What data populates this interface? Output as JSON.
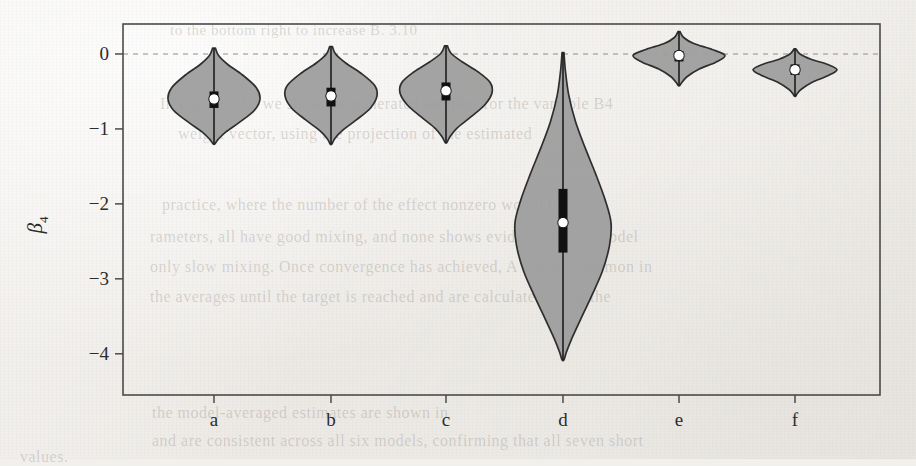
{
  "figure": {
    "background_color": "#f2f0ed",
    "plot_area": {
      "x": 123,
      "y": 24,
      "width": 757,
      "height": 371
    }
  },
  "ghost_text": [
    {
      "text": "to the bottom right to increase  B. 3.10",
      "x": 170,
      "y": 22,
      "size": 15
    },
    {
      "text": "In Figure 4.10 we show the generated samples for the variable B4",
      "x": 160,
      "y": 95,
      "size": 16
    },
    {
      "text": "weight vector, using the projection of the estimated",
      "x": 178,
      "y": 125,
      "size": 16
    },
    {
      "text": "practice, where the number of the effect nonzero would be par-",
      "x": 162,
      "y": 196,
      "size": 16
    },
    {
      "text": "rameters, all have good mixing, and none shows evidence of the model",
      "x": 150,
      "y": 228,
      "size": 16
    },
    {
      "text": "only slow mixing. Once convergence has achieved, A is most common in",
      "x": 150,
      "y": 258,
      "size": 16
    },
    {
      "text": "the averages until the target is reached and are calculated using the",
      "x": 150,
      "y": 288,
      "size": 16
    },
    {
      "text": "the model-averaged estimates are shown in",
      "x": 152,
      "y": 404,
      "size": 16
    },
    {
      "text": "and are consistent across all six models, confirming that all seven short",
      "x": 152,
      "y": 432,
      "size": 16
    },
    {
      "text": "values.",
      "x": 20,
      "y": 448,
      "size": 16
    }
  ],
  "axes": {
    "y_label": "β",
    "y_label_subscript": "4",
    "y_ticks": [
      {
        "value": 0,
        "label": "0"
      },
      {
        "value": -1,
        "label": "−1"
      },
      {
        "value": -2,
        "label": "−2"
      },
      {
        "value": -3,
        "label": "−3"
      },
      {
        "value": -4,
        "label": "−4"
      }
    ],
    "y_range": [
      -4.55,
      0.4
    ],
    "x_ticks": [
      "a",
      "b",
      "c",
      "d",
      "e",
      "f"
    ],
    "reference_line": {
      "value": 0,
      "style": "dashed",
      "color": "#8d8d8d"
    }
  },
  "chart_data": {
    "type": "violin",
    "title": "",
    "xlabel": "",
    "ylabel": "β₄",
    "ylim": [
      -4.55,
      0.4
    ],
    "grid": false,
    "legend": null,
    "categories": [
      "a",
      "b",
      "c",
      "d",
      "e",
      "f"
    ],
    "reference_line_y": 0,
    "series": [
      {
        "name": "a",
        "category": "a",
        "center_px": 214,
        "median": -0.6,
        "q1": -0.72,
        "q3": -0.5,
        "whisker_low": -1.12,
        "whisker_high": -0.08,
        "min": -1.2,
        "max": 0.08,
        "max_half_width_px": 46,
        "density": [
          {
            "y": 0.08,
            "w": 0.03
          },
          {
            "y": -0.02,
            "w": 0.1
          },
          {
            "y": -0.14,
            "w": 0.3
          },
          {
            "y": -0.28,
            "w": 0.62
          },
          {
            "y": -0.45,
            "w": 0.92
          },
          {
            "y": -0.6,
            "w": 1.0
          },
          {
            "y": -0.75,
            "w": 0.88
          },
          {
            "y": -0.9,
            "w": 0.58
          },
          {
            "y": -1.04,
            "w": 0.26
          },
          {
            "y": -1.14,
            "w": 0.09
          },
          {
            "y": -1.2,
            "w": 0.02
          }
        ]
      },
      {
        "name": "b",
        "category": "b",
        "center_px": 331,
        "median": -0.56,
        "q1": -0.7,
        "q3": -0.45,
        "whisker_low": -1.1,
        "whisker_high": -0.06,
        "min": -1.2,
        "max": 0.1,
        "max_half_width_px": 46,
        "density": [
          {
            "y": 0.1,
            "w": 0.03
          },
          {
            "y": 0.0,
            "w": 0.1
          },
          {
            "y": -0.12,
            "w": 0.32
          },
          {
            "y": -0.26,
            "w": 0.66
          },
          {
            "y": -0.42,
            "w": 0.95
          },
          {
            "y": -0.56,
            "w": 1.0
          },
          {
            "y": -0.72,
            "w": 0.86
          },
          {
            "y": -0.88,
            "w": 0.55
          },
          {
            "y": -1.02,
            "w": 0.25
          },
          {
            "y": -1.13,
            "w": 0.08
          },
          {
            "y": -1.2,
            "w": 0.02
          }
        ]
      },
      {
        "name": "c",
        "category": "c",
        "center_px": 446,
        "median": -0.49,
        "q1": -0.62,
        "q3": -0.38,
        "whisker_low": -1.08,
        "whisker_high": -0.02,
        "min": -1.18,
        "max": 0.11,
        "max_half_width_px": 46,
        "density": [
          {
            "y": 0.11,
            "w": 0.03
          },
          {
            "y": 0.01,
            "w": 0.11
          },
          {
            "y": -0.1,
            "w": 0.34
          },
          {
            "y": -0.24,
            "w": 0.7
          },
          {
            "y": -0.38,
            "w": 0.96
          },
          {
            "y": -0.52,
            "w": 1.0
          },
          {
            "y": -0.68,
            "w": 0.84
          },
          {
            "y": -0.84,
            "w": 0.54
          },
          {
            "y": -0.99,
            "w": 0.24
          },
          {
            "y": -1.11,
            "w": 0.08
          },
          {
            "y": -1.18,
            "w": 0.02
          }
        ]
      },
      {
        "name": "d",
        "category": "d",
        "center_px": 563,
        "median": -2.25,
        "q1": -2.65,
        "q3": -1.8,
        "whisker_low": -3.85,
        "whisker_high": -0.25,
        "min": -4.08,
        "max": 0.02,
        "max_half_width_px": 48,
        "density": [
          {
            "y": 0.02,
            "w": 0.02
          },
          {
            "y": -0.22,
            "w": 0.05
          },
          {
            "y": -0.55,
            "w": 0.12
          },
          {
            "y": -0.9,
            "w": 0.26
          },
          {
            "y": -1.25,
            "w": 0.46
          },
          {
            "y": -1.6,
            "w": 0.68
          },
          {
            "y": -1.95,
            "w": 0.88
          },
          {
            "y": -2.25,
            "w": 1.0
          },
          {
            "y": -2.55,
            "w": 0.97
          },
          {
            "y": -2.9,
            "w": 0.82
          },
          {
            "y": -3.25,
            "w": 0.58
          },
          {
            "y": -3.55,
            "w": 0.36
          },
          {
            "y": -3.8,
            "w": 0.18
          },
          {
            "y": -3.98,
            "w": 0.07
          },
          {
            "y": -4.08,
            "w": 0.02
          }
        ]
      },
      {
        "name": "e",
        "category": "e",
        "center_px": 679,
        "median": -0.02,
        "q1": -0.1,
        "q3": 0.04,
        "whisker_low": -0.32,
        "whisker_high": 0.22,
        "min": -0.42,
        "max": 0.3,
        "max_half_width_px": 46,
        "density": [
          {
            "y": 0.3,
            "w": 0.02
          },
          {
            "y": 0.22,
            "w": 0.1
          },
          {
            "y": 0.14,
            "w": 0.32
          },
          {
            "y": 0.06,
            "w": 0.72
          },
          {
            "y": -0.02,
            "w": 1.0
          },
          {
            "y": -0.11,
            "w": 0.8
          },
          {
            "y": -0.2,
            "w": 0.44
          },
          {
            "y": -0.3,
            "w": 0.18
          },
          {
            "y": -0.38,
            "w": 0.06
          },
          {
            "y": -0.42,
            "w": 0.02
          }
        ]
      },
      {
        "name": "f",
        "category": "f",
        "center_px": 795,
        "median": -0.21,
        "q1": -0.28,
        "q3": -0.14,
        "whisker_low": -0.48,
        "whisker_high": 0.02,
        "min": -0.56,
        "max": 0.07,
        "max_half_width_px": 42,
        "density": [
          {
            "y": 0.07,
            "w": 0.02
          },
          {
            "y": 0.0,
            "w": 0.12
          },
          {
            "y": -0.07,
            "w": 0.38
          },
          {
            "y": -0.14,
            "w": 0.78
          },
          {
            "y": -0.21,
            "w": 1.0
          },
          {
            "y": -0.29,
            "w": 0.78
          },
          {
            "y": -0.38,
            "w": 0.4
          },
          {
            "y": -0.47,
            "w": 0.15
          },
          {
            "y": -0.53,
            "w": 0.05
          },
          {
            "y": -0.56,
            "w": 0.02
          }
        ]
      }
    ]
  }
}
